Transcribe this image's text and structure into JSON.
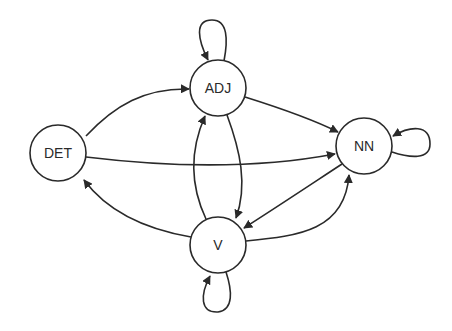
{
  "diagram": {
    "type": "state-transition-graph",
    "colors": {
      "stroke": "#2a2a2a",
      "background": "#ffffff",
      "node_fill": "#ffffff"
    },
    "nodes": [
      {
        "id": "DET",
        "label": "DET",
        "cx": 58,
        "cy": 153,
        "r": 28
      },
      {
        "id": "ADJ",
        "label": "ADJ",
        "cx": 218,
        "cy": 88,
        "r": 28
      },
      {
        "id": "NN",
        "label": "NN",
        "cx": 364,
        "cy": 146,
        "r": 28
      },
      {
        "id": "V",
        "label": "V",
        "cx": 218,
        "cy": 245,
        "r": 28
      }
    ],
    "edges": [
      {
        "from": "ADJ",
        "to": "ADJ",
        "kind": "self-loop"
      },
      {
        "from": "NN",
        "to": "NN",
        "kind": "self-loop"
      },
      {
        "from": "V",
        "to": "V",
        "kind": "self-loop"
      },
      {
        "from": "DET",
        "to": "ADJ"
      },
      {
        "from": "DET",
        "to": "NN"
      },
      {
        "from": "ADJ",
        "to": "NN"
      },
      {
        "from": "ADJ",
        "to": "V"
      },
      {
        "from": "V",
        "to": "ADJ"
      },
      {
        "from": "V",
        "to": "DET"
      },
      {
        "from": "V",
        "to": "NN"
      },
      {
        "from": "NN",
        "to": "V"
      }
    ]
  }
}
